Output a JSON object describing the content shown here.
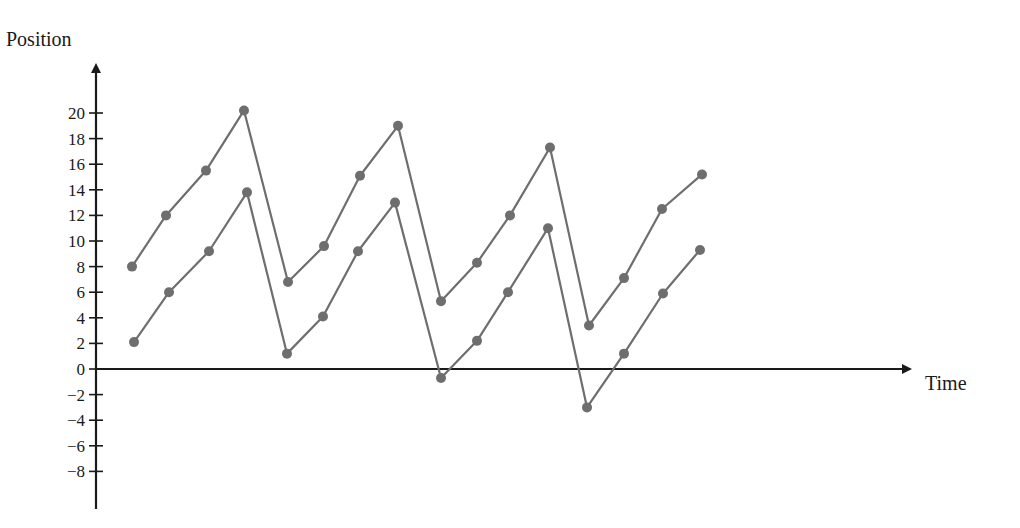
{
  "chart_data": {
    "type": "line",
    "title": "",
    "xlabel": "Time",
    "ylabel": "Position",
    "ylim": [
      -8,
      20
    ],
    "yticks": [
      20,
      18,
      16,
      14,
      12,
      10,
      8,
      6,
      4,
      2,
      0,
      -2,
      -4,
      -6,
      -8
    ],
    "ytick_labels": [
      "20",
      "18",
      "16",
      "14",
      "12",
      "10",
      "8",
      "6",
      "4",
      "2",
      "0",
      "−2",
      "−4",
      "−6",
      "−8"
    ],
    "grid": false,
    "legend": null,
    "x": [
      1,
      2,
      3,
      4,
      5,
      6,
      7,
      8,
      9,
      10,
      11,
      12,
      13,
      14,
      15,
      16
    ],
    "series": [
      {
        "name": "upper",
        "color": "#6e6e6e",
        "values": [
          8.0,
          12.0,
          15.5,
          20.2,
          6.8,
          9.6,
          15.1,
          19.0,
          5.3,
          8.3,
          12.0,
          17.3,
          3.4,
          7.1,
          12.5,
          15.2
        ]
      },
      {
        "name": "lower",
        "color": "#6e6e6e",
        "values": [
          2.1,
          6.0,
          9.2,
          13.8,
          1.2,
          4.1,
          9.2,
          13.0,
          -0.7,
          2.2,
          6.0,
          11.0,
          -3.0,
          1.2,
          5.9,
          9.3
        ]
      }
    ]
  },
  "layout": {
    "upper_px_x": [
      132,
      166,
      206,
      244,
      288,
      324,
      360,
      398,
      441,
      477,
      510,
      550,
      589,
      624,
      662,
      702
    ],
    "lower_px_x": [
      134,
      169,
      209,
      247,
      287,
      323,
      358,
      395,
      441,
      477,
      508,
      548,
      587,
      624,
      663,
      700
    ]
  }
}
